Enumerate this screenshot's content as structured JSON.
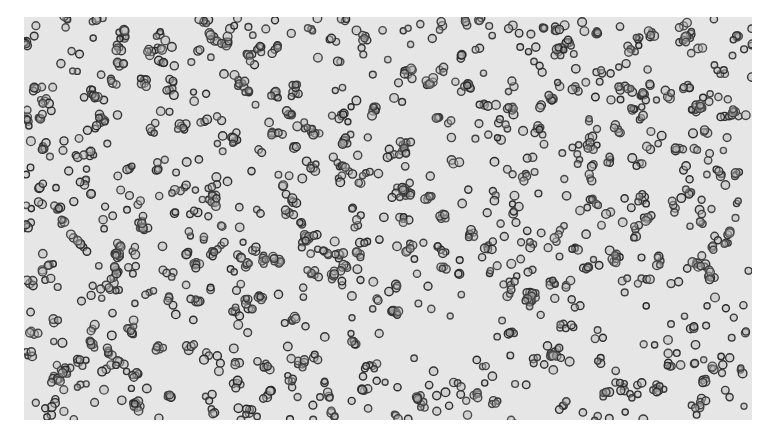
{
  "image": {
    "subject": "micrograph-blood-cells",
    "background_color": "#e6e6e6",
    "cell_color": "#3a3a3a",
    "cell_fill": "#b8b8b8",
    "cell_count_approx": 900
  }
}
